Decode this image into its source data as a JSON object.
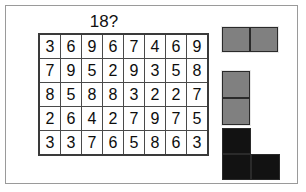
{
  "title": "18?",
  "grid": {
    "rows": 5,
    "columns": 8,
    "cells": [
      [
        "3",
        "6",
        "9",
        "6",
        "7",
        "4",
        "6",
        "9"
      ],
      [
        "7",
        "9",
        "5",
        "2",
        "9",
        "3",
        "5",
        "8"
      ],
      [
        "8",
        "5",
        "8",
        "8",
        "3",
        "2",
        "2",
        "7"
      ],
      [
        "2",
        "6",
        "4",
        "2",
        "7",
        "9",
        "7",
        "5"
      ],
      [
        "3",
        "3",
        "7",
        "6",
        "5",
        "8",
        "6",
        "3"
      ]
    ]
  },
  "pieces": [
    {
      "name": "horizontal-domino",
      "color": "#808080",
      "shape": [
        [
          "filled",
          "filled"
        ]
      ]
    },
    {
      "name": "vertical-domino",
      "color": "#808080",
      "shape": [
        [
          "filled"
        ],
        [
          "filled"
        ]
      ]
    },
    {
      "name": "l-tromino",
      "color": "#121212",
      "shape": [
        [
          "filled",
          "empty"
        ],
        [
          "filled",
          "filled"
        ]
      ]
    }
  ],
  "colors": {
    "frame_border": "#9a9a9a",
    "grid_border": "#3a3a3a",
    "cell_border": "#4a4a4a",
    "text": "#0d0d0d",
    "background": "#ffffff",
    "piece_gray": "#808080",
    "piece_black": "#121212"
  }
}
